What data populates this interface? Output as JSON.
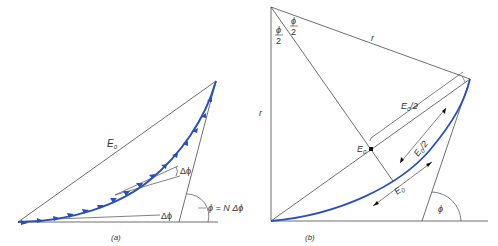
{
  "panels": [
    {
      "id": "a",
      "caption": "(a)",
      "labels": {
        "chord": "E",
        "chord_sub": "0",
        "delta_phi_top": "Δϕ",
        "delta_phi_bottom": "Δϕ",
        "phi_eq": "ϕ = N Δϕ"
      },
      "arrow_count": 16
    },
    {
      "id": "b",
      "caption": "(b)",
      "labels": {
        "half_angle_left_num": "ϕ",
        "half_angle_left_den": "2",
        "half_angle_right_num": "ϕ",
        "half_angle_right_den": "2",
        "radius_top": "r",
        "radius_left": "r",
        "half_chord": "E",
        "half_chord_sub": "0",
        "half_chord_suffix": "/2",
        "center_point": "E",
        "center_point_sub": "0",
        "arc_half": "E",
        "arc_half_sub": "0",
        "arc_half_suffix": "/2",
        "arc": "E",
        "arc_sub": "0",
        "angle": "ϕ"
      }
    }
  ],
  "colors": {
    "line": "#4a4a4a",
    "curve": "#2a4fb8",
    "arrow": "#2a4fb8"
  }
}
